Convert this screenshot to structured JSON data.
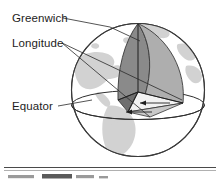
{
  "figure": {
    "labels": [
      {
        "id": "greenwich",
        "text": "Greenwich"
      },
      {
        "id": "longitude",
        "text": "Longitude"
      },
      {
        "id": "equator",
        "text": "Equator"
      }
    ],
    "colors": {
      "background": "#ffffff",
      "land": "#d2d2d2",
      "ocean": "#ffffff",
      "globe_outline": "#3a3a3a",
      "lune_dark": "#8a8a8a",
      "lune_light": "#aeaeae",
      "facet_dark": "#6e6e6e",
      "facet_light": "#f2f2f2",
      "label_text": "#1d1d1d",
      "leader_line": "#2a2a2a",
      "rule": "#4a4a4a"
    },
    "geometry": {
      "globe_center_x": 138,
      "globe_center_y": 90,
      "globe_radius": 67,
      "equator_y": 105
    }
  },
  "caption": {
    "rule_visible": true,
    "text_fragment": ""
  }
}
